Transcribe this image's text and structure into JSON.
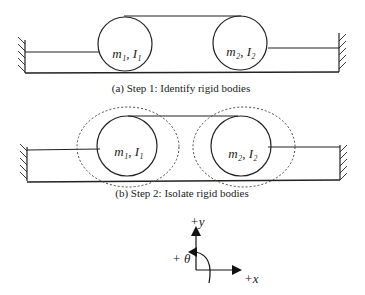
{
  "figure_a": {
    "caption": "(a) Step 1: Identify rigid bodies",
    "body1_label": "m₁, I₁",
    "body2_label": "m₂, I₂"
  },
  "figure_b": {
    "caption": "(b) Step 2: Isolate rigid bodies",
    "body1_label": "m₁, I₁",
    "body2_label": "m₂, I₂"
  },
  "axes": {
    "y_label": "+y",
    "x_label": "+x",
    "theta_label": "+ θ"
  },
  "colors": {
    "line": "#222222",
    "dashed": "#444444",
    "background": "#ffffff"
  }
}
